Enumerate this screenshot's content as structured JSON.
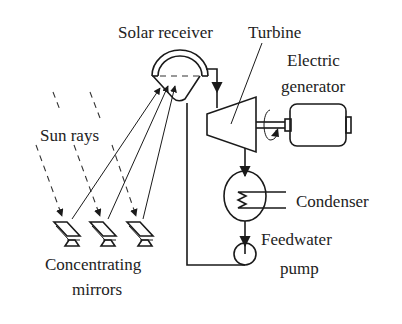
{
  "diagram": {
    "labels": {
      "solar_receiver": "Solar receiver",
      "turbine": "Turbine",
      "electric_generator_line1": "Electric",
      "electric_generator_line2": "generator",
      "sun_rays": "Sun rays",
      "condenser": "Condenser",
      "feedwater_pump_line1": "Feedwater",
      "feedwater_pump_line2": "pump",
      "concentrating_mirrors_line1": "Concentrating",
      "concentrating_mirrors_line2": "mirrors"
    },
    "components": [
      "solar receiver",
      "turbine",
      "electric generator",
      "condenser",
      "feedwater pump",
      "concentrating mirrors"
    ],
    "mirror_count": 3,
    "colors": {
      "line": "#1a1a1a",
      "text": "#222222",
      "background": "#ffffff"
    }
  }
}
